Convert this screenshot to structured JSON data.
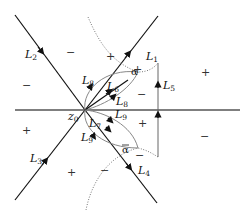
{
  "diagram": {
    "origin_label": "z",
    "origin_sub": "0",
    "alpha_label": "α",
    "alpha_bar_label": "α",
    "contours": [
      {
        "id": "L1",
        "name": "L",
        "sub": "1"
      },
      {
        "id": "L2",
        "name": "L",
        "sub": "2"
      },
      {
        "id": "L3",
        "name": "L",
        "sub": "3"
      },
      {
        "id": "L4",
        "name": "L",
        "sub": "4"
      },
      {
        "id": "L5",
        "name": "L",
        "sub": "5"
      },
      {
        "id": "L6",
        "name": "L",
        "sub": "6"
      },
      {
        "id": "L7",
        "name": "L",
        "sub": "7"
      },
      {
        "id": "L8a",
        "name": "L",
        "sub": "8"
      },
      {
        "id": "L8b",
        "name": "L",
        "sub": "8"
      },
      {
        "id": "L9a",
        "name": "L",
        "sub": "9"
      },
      {
        "id": "L9b",
        "name": "L",
        "sub": "9"
      }
    ],
    "signs": [
      {
        "pos": "upper-left-sector",
        "value": "−"
      },
      {
        "pos": "upper-middle",
        "value": "+"
      },
      {
        "pos": "near-alpha",
        "value": "+"
      },
      {
        "pos": "right-upper-far",
        "value": "+"
      },
      {
        "pos": "right-upper-inner",
        "value": "−"
      },
      {
        "pos": "left-middle",
        "value": "−"
      },
      {
        "pos": "left-lower",
        "value": "+"
      },
      {
        "pos": "lower-middle",
        "value": "+"
      },
      {
        "pos": "right-lower-inner",
        "value": "+"
      },
      {
        "pos": "near-alpha-bar",
        "value": "−"
      },
      {
        "pos": "lower-dotted",
        "value": "−"
      },
      {
        "pos": "right-lower-far",
        "value": "−"
      }
    ]
  }
}
